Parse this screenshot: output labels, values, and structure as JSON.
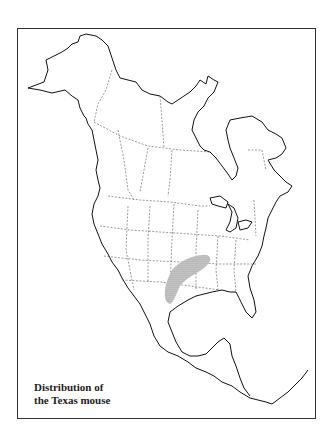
{
  "figure": {
    "caption_line1": "Distribution of",
    "caption_line2": "the Texas mouse",
    "species": "Texas mouse",
    "region_shown": "North America",
    "range_description": "Shaded area across eastern Oklahoma, central Texas, western Arkansas, southwestern Missouri",
    "colors": {
      "frame": "#333333",
      "coast": "#111111",
      "borders": "#555555",
      "range_fill": "#9a9a9a"
    }
  }
}
